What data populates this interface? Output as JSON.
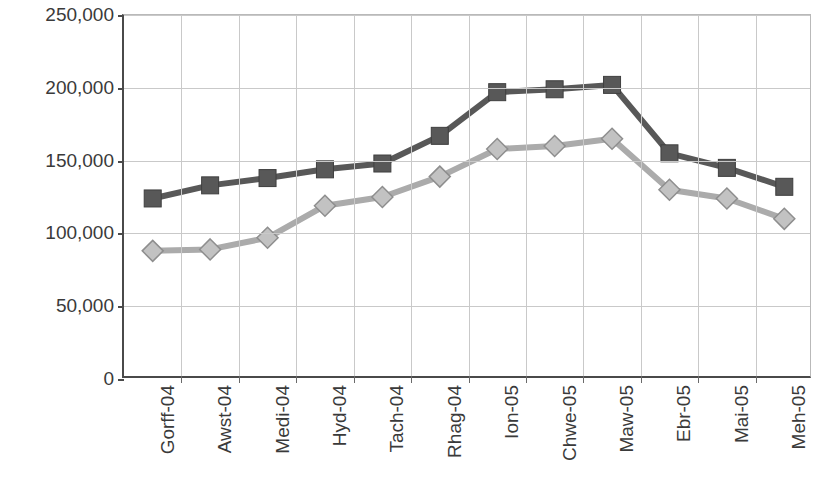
{
  "chart_data": {
    "type": "line",
    "title": "",
    "subtitle": "",
    "xlabel": "",
    "ylabel": "Achosion o falaria",
    "categories": [
      "Gorff-04",
      "Awst-04",
      "Medi-04",
      "Hyd-04",
      "Tach-04",
      "Rhag-04",
      "Ion-05",
      "Chwe-05",
      "Maw-05",
      "Ebr-05",
      "Mai-05",
      "Meh-05"
    ],
    "series": [
      {
        "name": "series-dark-squares",
        "marker": "square",
        "color": "#585858",
        "values": [
          124000,
          133000,
          138000,
          144000,
          148000,
          167000,
          197000,
          199000,
          202000,
          155000,
          145000,
          132000
        ]
      },
      {
        "name": "series-light-diamonds",
        "marker": "diamond",
        "color": "#ABABAB",
        "values": [
          88000,
          89000,
          97000,
          119000,
          125000,
          139000,
          158000,
          160000,
          165000,
          130000,
          124000,
          110000
        ]
      }
    ],
    "ylim": [
      0,
      250000
    ],
    "y_ticks": [
      0,
      50000,
      100000,
      150000,
      200000,
      250000
    ],
    "y_tick_labels": [
      "0",
      "50,000",
      "100,000",
      "150,000",
      "200,000",
      "250,000"
    ],
    "grid": "both",
    "legend": "none",
    "axis_color": "#4a4a4a",
    "grid_color": "#c9c9c9"
  }
}
